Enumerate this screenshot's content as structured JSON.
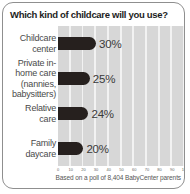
{
  "card": {
    "title": "Which kind of childcare will you use?",
    "footnote": "Based on a poll of 8,404 BabyCenter parents"
  },
  "colors": {
    "bar": "#26201e",
    "plot_background": "#d7d7d7",
    "gridline": "#f2f2f2",
    "card_border": "#8f8f8f"
  },
  "chart_data": {
    "type": "bar",
    "orientation": "horizontal",
    "title": "Which kind of childcare will you use?",
    "categories": [
      "Childcare\ncenter",
      "Private in-\nhome care\n(nannies,\nbabysitters)",
      "Relative\ncare",
      "Family\ndaycare"
    ],
    "values": [
      30,
      25,
      24,
      20
    ],
    "value_labels": [
      "30%",
      "25%",
      "24%",
      "20%"
    ],
    "xlim": [
      0,
      100
    ],
    "x_ticks": [
      0,
      10,
      20,
      30,
      40,
      50,
      60,
      70,
      80,
      90,
      100
    ],
    "xlabel": "",
    "ylabel": "",
    "grid": true,
    "legend": false,
    "annotation": "Based on a poll of 8,404 BabyCenter parents"
  }
}
